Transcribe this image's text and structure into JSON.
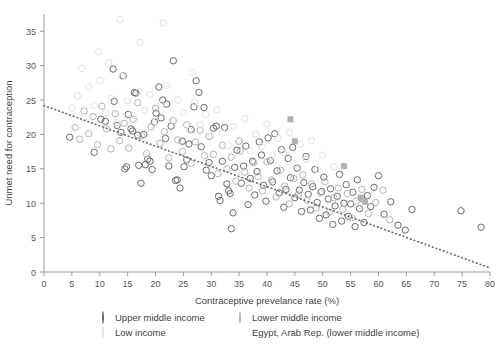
{
  "chart_data": {
    "type": "scatter",
    "title": "",
    "xlabel": "Contraceptive prevelance rate (%)",
    "ylabel": "Unmet need for contraception",
    "xlim": [
      0,
      80
    ],
    "ylim": [
      0,
      37.5
    ],
    "xticks": [
      0,
      5,
      10,
      15,
      20,
      25,
      30,
      35,
      40,
      45,
      50,
      55,
      60,
      65,
      70,
      75,
      80
    ],
    "yticks": [
      0,
      5,
      10,
      15,
      20,
      25,
      30,
      35
    ],
    "grid": false,
    "legend_position": "bottom",
    "trendline": {
      "style": "dotted",
      "color": "#6e6e6e",
      "x0": 0,
      "y0": 24.2,
      "x1": 80,
      "y1": 0.6
    },
    "series": [
      {
        "name": "Upper middle income",
        "marker": "circle",
        "color": "#6b6b6b",
        "points": [
          [
            4.6,
            19.6
          ],
          [
            9.0,
            17.4
          ],
          [
            10.2,
            22.2
          ],
          [
            11.0,
            21.9
          ],
          [
            12.4,
            29.5
          ],
          [
            12.6,
            24.8
          ],
          [
            13.1,
            21.3
          ],
          [
            13.8,
            20.3
          ],
          [
            14.2,
            28.5
          ],
          [
            14.5,
            15.0
          ],
          [
            14.8,
            15.3
          ],
          [
            15.1,
            22.9
          ],
          [
            15.6,
            20.8
          ],
          [
            15.9,
            20.5
          ],
          [
            16.2,
            26.1
          ],
          [
            16.5,
            26.0
          ],
          [
            16.8,
            19.9
          ],
          [
            17.0,
            15.5
          ],
          [
            17.4,
            12.9
          ],
          [
            17.9,
            20.0
          ],
          [
            18.2,
            15.6
          ],
          [
            18.6,
            16.4
          ],
          [
            19.0,
            16.1
          ],
          [
            19.4,
            14.9
          ],
          [
            19.8,
            21.8
          ],
          [
            20.1,
            23.1
          ],
          [
            20.6,
            26.9
          ],
          [
            21.0,
            22.4
          ],
          [
            21.3,
            25.0
          ],
          [
            21.8,
            19.4
          ],
          [
            22.0,
            24.4
          ],
          [
            22.4,
            15.4
          ],
          [
            22.8,
            21.2
          ],
          [
            23.2,
            30.7
          ],
          [
            23.6,
            13.3
          ],
          [
            23.9,
            13.4
          ],
          [
            24.4,
            12.2
          ],
          [
            24.8,
            19.0
          ],
          [
            25.1,
            15.3
          ],
          [
            25.6,
            16.3
          ],
          [
            26.0,
            18.6
          ],
          [
            26.4,
            20.7
          ],
          [
            26.9,
            24.0
          ],
          [
            27.3,
            27.8
          ],
          [
            27.8,
            26.1
          ],
          [
            28.2,
            18.2
          ],
          [
            28.7,
            23.9
          ],
          [
            29.1,
            14.8
          ],
          [
            29.6,
            15.9
          ],
          [
            30.0,
            14.0
          ],
          [
            30.4,
            20.9
          ],
          [
            30.9,
            21.2
          ],
          [
            31.3,
            11.0
          ],
          [
            31.6,
            10.4
          ],
          [
            32.0,
            16.1
          ],
          [
            32.4,
            21.0
          ],
          [
            32.8,
            12.8
          ],
          [
            33.1,
            11.8
          ],
          [
            33.4,
            11.4
          ],
          [
            33.6,
            6.3
          ],
          [
            33.9,
            8.6
          ],
          [
            34.2,
            15.2
          ],
          [
            34.6,
            17.7
          ],
          [
            35.0,
            19.0
          ],
          [
            35.4,
            12.9
          ],
          [
            35.8,
            15.4
          ],
          [
            36.2,
            18.3
          ],
          [
            36.6,
            9.8
          ],
          [
            37.0,
            13.6
          ],
          [
            37.4,
            16.1
          ],
          [
            37.8,
            11.2
          ],
          [
            38.2,
            14.6
          ],
          [
            38.6,
            18.9
          ],
          [
            39.0,
            17.0
          ],
          [
            39.4,
            12.6
          ],
          [
            39.8,
            10.3
          ],
          [
            40.2,
            19.5
          ],
          [
            40.6,
            16.2
          ],
          [
            41.0,
            13.1
          ],
          [
            41.4,
            20.1
          ],
          [
            41.8,
            14.7
          ],
          [
            42.2,
            11.5
          ],
          [
            42.6,
            17.8
          ],
          [
            43.0,
            9.4
          ],
          [
            43.4,
            12.0
          ],
          [
            43.8,
            16.5
          ],
          [
            44.2,
            13.7
          ],
          [
            44.6,
            18.1
          ],
          [
            45.0,
            10.8
          ],
          [
            45.4,
            15.1
          ],
          [
            45.8,
            11.9
          ],
          [
            46.2,
            8.8
          ],
          [
            46.6,
            13.0
          ],
          [
            47.0,
            16.8
          ],
          [
            47.4,
            11.3
          ],
          [
            47.8,
            9.0
          ],
          [
            48.2,
            12.4
          ],
          [
            48.6,
            14.9
          ],
          [
            49.0,
            10.1
          ],
          [
            49.4,
            7.8
          ],
          [
            49.8,
            11.7
          ],
          [
            50.2,
            13.8
          ],
          [
            50.6,
            8.3
          ],
          [
            51.0,
            10.6
          ],
          [
            51.4,
            12.1
          ],
          [
            51.8,
            6.9
          ],
          [
            52.2,
            9.6
          ],
          [
            52.6,
            11.0
          ],
          [
            53.0,
            14.2
          ],
          [
            53.4,
            7.4
          ],
          [
            53.8,
            10.0
          ],
          [
            54.2,
            12.7
          ],
          [
            54.6,
            8.1
          ],
          [
            55.0,
            9.9
          ],
          [
            55.4,
            11.6
          ],
          [
            55.8,
            6.6
          ],
          [
            56.2,
            13.4
          ],
          [
            56.6,
            9.2
          ],
          [
            57.0,
            10.7
          ],
          [
            57.4,
            7.2
          ],
          [
            58.0,
            11.1
          ],
          [
            58.6,
            9.5
          ],
          [
            59.2,
            12.3
          ],
          [
            60.0,
            14.0
          ],
          [
            61.0,
            8.4
          ],
          [
            62.2,
            10.2
          ],
          [
            63.5,
            6.8
          ],
          [
            64.8,
            6.1
          ],
          [
            66.0,
            9.1
          ],
          [
            74.8,
            8.9
          ],
          [
            78.4,
            6.5
          ]
        ]
      },
      {
        "name": "Lower middle income",
        "marker": "circle",
        "color": "#b4b4b4",
        "points": [
          [
            5.6,
            21.0
          ],
          [
            6.4,
            19.3
          ],
          [
            7.2,
            23.4
          ],
          [
            8.0,
            20.1
          ],
          [
            8.8,
            22.6
          ],
          [
            9.6,
            18.5
          ],
          [
            10.4,
            24.1
          ],
          [
            11.2,
            20.8
          ],
          [
            12.0,
            17.9
          ],
          [
            12.8,
            23.0
          ],
          [
            13.6,
            19.1
          ],
          [
            14.4,
            21.6
          ],
          [
            15.2,
            18.0
          ],
          [
            16.0,
            22.2
          ],
          [
            16.8,
            24.6
          ],
          [
            17.6,
            19.8
          ],
          [
            18.4,
            17.2
          ],
          [
            19.2,
            21.1
          ],
          [
            20.0,
            23.8
          ],
          [
            20.8,
            18.7
          ],
          [
            21.6,
            20.4
          ],
          [
            22.4,
            16.6
          ],
          [
            23.2,
            22.0
          ],
          [
            24.0,
            19.2
          ],
          [
            24.8,
            17.5
          ],
          [
            25.6,
            21.4
          ],
          [
            26.4,
            15.8
          ],
          [
            27.2,
            18.9
          ],
          [
            28.0,
            20.6
          ],
          [
            28.8,
            16.9
          ],
          [
            29.6,
            19.7
          ],
          [
            30.4,
            17.1
          ],
          [
            31.2,
            14.3
          ],
          [
            32.0,
            18.4
          ],
          [
            32.8,
            15.0
          ],
          [
            33.6,
            16.7
          ],
          [
            34.4,
            13.2
          ],
          [
            35.2,
            17.6
          ],
          [
            36.0,
            14.5
          ],
          [
            36.8,
            12.2
          ],
          [
            37.6,
            15.9
          ],
          [
            38.4,
            13.9
          ],
          [
            39.2,
            11.8
          ],
          [
            40.0,
            16.0
          ],
          [
            40.8,
            13.4
          ],
          [
            41.6,
            10.9
          ],
          [
            42.4,
            14.8
          ],
          [
            43.2,
            12.5
          ],
          [
            44.0,
            9.9
          ],
          [
            44.8,
            13.6
          ],
          [
            45.6,
            11.2
          ],
          [
            46.4,
            14.1
          ],
          [
            47.2,
            10.4
          ],
          [
            48.0,
            12.8
          ],
          [
            48.8,
            9.3
          ],
          [
            49.6,
            11.5
          ],
          [
            50.4,
            13.1
          ],
          [
            51.2,
            8.7
          ],
          [
            52.0,
            10.8
          ],
          [
            52.8,
            12.2
          ],
          [
            53.6,
            9.1
          ],
          [
            54.4,
            11.4
          ],
          [
            55.2,
            7.9
          ],
          [
            56.0,
            10.3
          ],
          [
            57.0,
            12.0
          ],
          [
            58.2,
            8.5
          ],
          [
            59.5,
            10.1
          ],
          [
            60.8,
            11.9
          ],
          [
            62.0,
            7.6
          ]
        ]
      },
      {
        "name": "Low income",
        "marker": "circle",
        "color": "#e2e2e2",
        "points": [
          [
            5.0,
            23.8
          ],
          [
            6.0,
            25.6
          ],
          [
            7.0,
            22.4
          ],
          [
            8.0,
            26.9
          ],
          [
            9.0,
            24.2
          ],
          [
            10.0,
            27.8
          ],
          [
            11.0,
            23.1
          ],
          [
            12.0,
            25.2
          ],
          [
            13.0,
            21.7
          ],
          [
            13.6,
            36.7
          ],
          [
            14.0,
            28.4
          ],
          [
            15.0,
            24.9
          ],
          [
            16.0,
            22.8
          ],
          [
            17.0,
            26.2
          ],
          [
            18.0,
            23.5
          ],
          [
            19.0,
            25.8
          ],
          [
            20.0,
            21.9
          ],
          [
            21.0,
            24.4
          ],
          [
            22.0,
            27.1
          ],
          [
            23.0,
            22.1
          ],
          [
            24.0,
            25.0
          ],
          [
            25.0,
            23.2
          ],
          [
            26.0,
            20.6
          ],
          [
            27.0,
            24.7
          ],
          [
            28.0,
            21.4
          ],
          [
            29.0,
            22.9
          ],
          [
            30.0,
            19.8
          ],
          [
            31.0,
            23.6
          ],
          [
            32.0,
            20.2
          ],
          [
            33.0,
            18.4
          ],
          [
            34.0,
            21.1
          ],
          [
            35.0,
            19.0
          ],
          [
            36.0,
            22.3
          ],
          [
            37.0,
            17.6
          ],
          [
            38.0,
            20.0
          ],
          [
            39.0,
            18.2
          ],
          [
            40.0,
            21.5
          ],
          [
            41.0,
            16.9
          ],
          [
            42.0,
            19.4
          ],
          [
            43.0,
            17.3
          ],
          [
            44.0,
            20.3
          ],
          [
            45.0,
            15.7
          ],
          [
            46.0,
            18.6
          ],
          [
            47.0,
            16.4
          ],
          [
            48.0,
            19.1
          ],
          [
            49.0,
            14.9
          ],
          [
            50.0,
            17.0
          ],
          [
            52.0,
            15.3
          ],
          [
            9.8,
            32.0
          ],
          [
            17.2,
            33.4
          ],
          [
            21.4,
            36.2
          ],
          [
            26.6,
            29.0
          ],
          [
            6.8,
            29.6
          ],
          [
            11.6,
            30.4
          ]
        ]
      },
      {
        "name": "Egypt, Arab Rep. (lower middle income)",
        "marker": "square",
        "color": "#b0b0b0",
        "points": [
          [
            44.2,
            22.2
          ],
          [
            45.0,
            19.0
          ],
          [
            53.8,
            15.4
          ],
          [
            56.8,
            10.8
          ],
          [
            57.6,
            10.2
          ]
        ]
      }
    ]
  },
  "legend": {
    "rows": [
      [
        {
          "label": "Upper middle income",
          "marker": "circle-dark"
        },
        {
          "label": "Lower middle income",
          "marker": "circle-light"
        }
      ],
      [
        {
          "label": "Low income",
          "marker": "circle-faint"
        },
        {
          "label": "Egypt, Arab Rep. (lower middle income)",
          "marker": "square-gray"
        }
      ]
    ]
  }
}
